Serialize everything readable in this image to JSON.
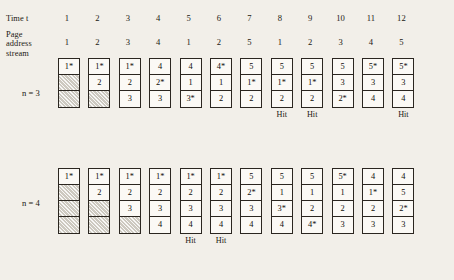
{
  "header": {
    "time_label": "Time t",
    "page_address_stream_label_lines": [
      "Page",
      "address",
      "stream"
    ],
    "time_values": [
      "1",
      "2",
      "3",
      "4",
      "5",
      "6",
      "7",
      "8",
      "9",
      "10",
      "11",
      "12"
    ],
    "page_address_stream": [
      "1",
      "2",
      "3",
      "4",
      "1",
      "2",
      "5",
      "1",
      "2",
      "3",
      "4",
      "5"
    ]
  },
  "hit_label": "Hit",
  "tables": [
    {
      "name": "n-3",
      "label": "n = 3",
      "frames": 3,
      "columns": [
        {
          "t": "1",
          "cells": [
            "1*",
            "",
            ""
          ],
          "hit": false
        },
        {
          "t": "2",
          "cells": [
            "1*",
            "2",
            ""
          ],
          "hit": false
        },
        {
          "t": "3",
          "cells": [
            "1*",
            "2",
            "3"
          ],
          "hit": false
        },
        {
          "t": "4",
          "cells": [
            "4",
            "2*",
            "3"
          ],
          "hit": false
        },
        {
          "t": "5",
          "cells": [
            "4",
            "1",
            "3*"
          ],
          "hit": false
        },
        {
          "t": "6",
          "cells": [
            "4*",
            "1",
            "2"
          ],
          "hit": false
        },
        {
          "t": "7",
          "cells": [
            "5",
            "1*",
            "2"
          ],
          "hit": false
        },
        {
          "t": "8",
          "cells": [
            "5",
            "1*",
            "2"
          ],
          "hit": true
        },
        {
          "t": "9",
          "cells": [
            "5",
            "1*",
            "2"
          ],
          "hit": true
        },
        {
          "t": "10",
          "cells": [
            "5",
            "3",
            "2*"
          ],
          "hit": false
        },
        {
          "t": "11",
          "cells": [
            "5*",
            "3",
            "4"
          ],
          "hit": false
        },
        {
          "t": "12",
          "cells": [
            "5*",
            "3",
            "4"
          ],
          "hit": true
        }
      ]
    },
    {
      "name": "n-4",
      "label": "n = 4",
      "frames": 4,
      "columns": [
        {
          "t": "1",
          "cells": [
            "1*",
            "",
            "",
            ""
          ],
          "hit": false
        },
        {
          "t": "2",
          "cells": [
            "1*",
            "2",
            "",
            ""
          ],
          "hit": false
        },
        {
          "t": "3",
          "cells": [
            "1*",
            "2",
            "3",
            ""
          ],
          "hit": false
        },
        {
          "t": "4",
          "cells": [
            "1*",
            "2",
            "3",
            "4"
          ],
          "hit": false
        },
        {
          "t": "5",
          "cells": [
            "1*",
            "2",
            "3",
            "4"
          ],
          "hit": true
        },
        {
          "t": "6",
          "cells": [
            "1*",
            "2",
            "3",
            "4"
          ],
          "hit": true
        },
        {
          "t": "7",
          "cells": [
            "5",
            "2*",
            "3",
            "4"
          ],
          "hit": false
        },
        {
          "t": "8",
          "cells": [
            "5",
            "1",
            "3*",
            "4"
          ],
          "hit": false
        },
        {
          "t": "9",
          "cells": [
            "5",
            "1",
            "2",
            "4*"
          ],
          "hit": false
        },
        {
          "t": "10",
          "cells": [
            "5*",
            "1",
            "2",
            "3"
          ],
          "hit": false
        },
        {
          "t": "11",
          "cells": [
            "4",
            "1*",
            "2",
            "3"
          ],
          "hit": false
        },
        {
          "t": "12",
          "cells": [
            "4",
            "5",
            "2*",
            "3"
          ],
          "hit": false
        }
      ]
    }
  ],
  "layout": {
    "col_x_start": 58,
    "col_step": 30.4,
    "n3_top": 58,
    "n4_top": 168,
    "hit_offset": 4
  }
}
